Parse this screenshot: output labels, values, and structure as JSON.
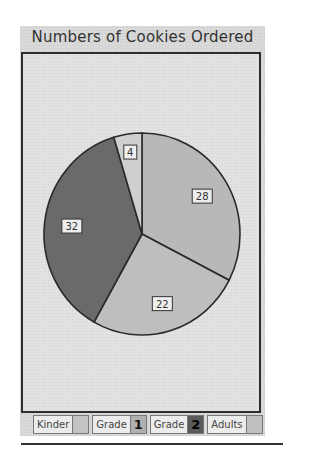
{
  "chart_data": {
    "type": "pie",
    "title": "Numbers of Cookies Ordered",
    "categories": [
      "Kinder",
      "Grade 1",
      "Grade 2",
      "Adults"
    ],
    "slices": [
      {
        "label": "28",
        "value": 28,
        "fill": "#b8b8b8"
      },
      {
        "label": "22",
        "value": 22,
        "fill": "#bebebe"
      },
      {
        "label": "32",
        "value": 32,
        "fill": "#6a6a6a"
      },
      {
        "label": "4",
        "value": 4,
        "fill": "#cfcfcf"
      }
    ],
    "start_angle_deg": 0,
    "direction": "clockwise",
    "legend_position": "bottom"
  },
  "title": "Numbers of Cookies Ordered",
  "legend": [
    {
      "label": "Kinder",
      "glyph": "",
      "swatch": "#c4c4c4"
    },
    {
      "label": "Grade",
      "glyph": "1",
      "swatch": "#b0b0b0"
    },
    {
      "label": "Grade",
      "glyph": "2",
      "swatch": "#5a5a5a"
    },
    {
      "label": "Adults",
      "glyph": "",
      "swatch": "#c0c0c0"
    }
  ]
}
